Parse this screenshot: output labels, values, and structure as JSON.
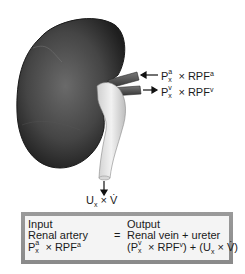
{
  "figure": {
    "arterial_label": {
      "P": "P",
      "sup": "a",
      "sub": "x",
      "times": "×",
      "RPF": "RPF",
      "RPF_sup": "a"
    },
    "venous_label": {
      "P": "P",
      "sup": "v",
      "sub": "x",
      "times": "×",
      "RPF": "RPF",
      "RPF_sup": "v"
    },
    "urine_label": {
      "U": "U",
      "sub": "x",
      "times": "×",
      "V": "V̇"
    }
  },
  "equation_box": {
    "input": {
      "title": "Input",
      "source": "Renal artery",
      "formula": {
        "P": "P",
        "sup": "a",
        "sub": "x",
        "times": "×",
        "RPF": "RPF",
        "RPF_sup": "a"
      }
    },
    "equals": "=",
    "output": {
      "title": "Output",
      "source": "Renal vein + ureter",
      "formula_text": "(Pᵛₓ × RPFᵛ) + (Uₓ × V̇)",
      "formula": {
        "open1": "(",
        "P": "P",
        "sup": "v",
        "sub": "x",
        "times1": "×",
        "RPF": "RPF",
        "RPF_sup": "v",
        "close1": ")",
        "plus": "+",
        "open2": "(",
        "U": "U",
        "U_sub": "x",
        "times2": "×",
        "V": "V̇",
        "close2": ")"
      }
    }
  },
  "colors": {
    "kidney_dark": "#2a2a2a",
    "kidney_mid": "#5a5a5a",
    "ureter": "#e6e6e6",
    "vessel": "#555555",
    "box_border": "#909090",
    "box_fill": "#f4f4f4"
  }
}
